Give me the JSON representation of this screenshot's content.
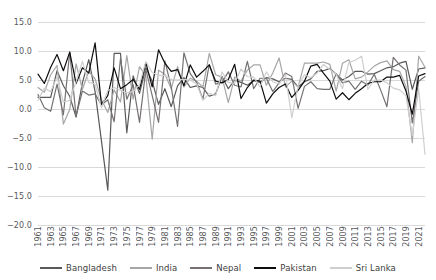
{
  "chart_data": {
    "type": "line",
    "title": "",
    "xlabel": "",
    "ylabel": "",
    "ylim": [
      -20.0,
      15.0
    ],
    "ytick_step": 5.0,
    "grid": true,
    "legend_position": "bottom",
    "y_ticks": [
      "15.0",
      "10.0",
      "5.0",
      "0.0",
      "-5.0",
      "-10.0",
      "-15.0",
      "-20.0"
    ],
    "y_tick_values": [
      15.0,
      10.0,
      5.0,
      0.0,
      -5.0,
      -10.0,
      -15.0,
      -20.0
    ],
    "x_tick_labels": [
      "1961",
      "1963",
      "1965",
      "1967",
      "1969",
      "1971",
      "1973",
      "1975",
      "1977",
      "1979",
      "1981",
      "1983",
      "1985",
      "1987",
      "1989",
      "1991",
      "1993",
      "1995",
      "1997",
      "1999",
      "2001",
      "2003",
      "2005",
      "2007",
      "2009",
      "2011",
      "2013",
      "2015",
      "2017",
      "2019",
      "2021"
    ],
    "x": [
      1961,
      1962,
      1963,
      1964,
      1965,
      1966,
      1967,
      1968,
      1969,
      1970,
      1971,
      1972,
      1973,
      1974,
      1975,
      1976,
      1977,
      1978,
      1979,
      1980,
      1981,
      1982,
      1983,
      1984,
      1985,
      1986,
      1987,
      1988,
      1989,
      1990,
      1991,
      1992,
      1993,
      1994,
      1995,
      1996,
      1997,
      1998,
      1999,
      2000,
      2001,
      2002,
      2003,
      2004,
      2005,
      2006,
      2007,
      2008,
      2009,
      2010,
      2011,
      2012,
      2013,
      2014,
      2015,
      2016,
      2017,
      2018,
      2019,
      2020,
      2021,
      2022
    ],
    "series": [
      {
        "name": "Bangladesh",
        "color": "#595959",
        "values": [
          2.0,
          2.0,
          2.0,
          6.6,
          4.0,
          2.2,
          -1.4,
          4.5,
          8.5,
          3.0,
          -5.5,
          -14.0,
          9.6,
          9.6,
          -4.1,
          5.7,
          2.7,
          7.1,
          4.8,
          0.8,
          3.5,
          0.4,
          4.0,
          5.4,
          3.7,
          4.0,
          3.7,
          2.2,
          2.6,
          5.6,
          3.5,
          5.0,
          4.6,
          4.1,
          4.9,
          4.6,
          5.4,
          5.2,
          4.7,
          5.3,
          5.1,
          3.8,
          4.7,
          5.2,
          6.5,
          6.6,
          7.0,
          6.0,
          5.0,
          5.6,
          6.5,
          6.5,
          6.0,
          6.1,
          6.6,
          7.1,
          7.3,
          7.9,
          8.2,
          3.4,
          6.9,
          7.1
        ]
      },
      {
        "name": "India",
        "color": "#a6a6a6",
        "values": [
          3.7,
          2.9,
          5.9,
          7.5,
          -2.6,
          -0.1,
          7.8,
          3.4,
          6.5,
          5.2,
          1.6,
          -0.6,
          3.3,
          1.2,
          9.2,
          1.7,
          7.3,
          5.7,
          -5.2,
          6.7,
          6.0,
          3.5,
          7.3,
          3.8,
          5.3,
          4.8,
          3.8,
          9.6,
          5.9,
          5.5,
          1.1,
          5.5,
          4.8,
          6.7,
          7.6,
          7.6,
          4.1,
          6.2,
          8.8,
          3.8,
          4.8,
          3.8,
          7.9,
          7.9,
          7.9,
          8.1,
          7.7,
          3.1,
          7.9,
          8.5,
          5.2,
          5.5,
          6.4,
          7.4,
          8.0,
          8.3,
          6.8,
          6.5,
          3.9,
          -5.8,
          9.1,
          7.2
        ]
      },
      {
        "name": "Nepal",
        "color": "#767171",
        "values": [
          2.5,
          0.2,
          -0.4,
          4.3,
          -1.0,
          9.8,
          -1.2,
          3.1,
          2.4,
          2.6,
          0.7,
          1.6,
          -2.2,
          8.7,
          1.7,
          4.2,
          -2.3,
          6.8,
          2.3,
          -2.3,
          8.3,
          3.8,
          -3.0,
          9.7,
          6.1,
          4.6,
          1.7,
          7.7,
          4.3,
          4.6,
          6.4,
          4.1,
          3.8,
          8.2,
          3.5,
          5.3,
          5.3,
          3.0,
          4.5,
          6.2,
          5.6,
          0.1,
          3.9,
          4.7,
          3.5,
          3.4,
          3.4,
          6.1,
          4.5,
          4.8,
          3.4,
          4.8,
          4.1,
          6.0,
          3.3,
          0.4,
          8.9,
          7.6,
          6.7,
          -2.4,
          4.8,
          5.6
        ]
      },
      {
        "name": "Pakistan",
        "color": "#0d0d0d",
        "values": [
          6.0,
          4.4,
          7.2,
          9.4,
          6.6,
          9.8,
          4.4,
          7.1,
          6.2,
          11.4,
          0.8,
          2.3,
          7.1,
          3.5,
          4.2,
          5.1,
          3.4,
          8.0,
          3.8,
          10.2,
          7.9,
          6.5,
          6.8,
          4.0,
          7.6,
          5.5,
          6.5,
          7.6,
          4.8,
          4.5,
          5.1,
          7.7,
          1.8,
          3.7,
          5.0,
          4.8,
          1.0,
          2.6,
          3.7,
          4.3,
          2.0,
          3.2,
          4.8,
          7.4,
          7.7,
          6.2,
          4.8,
          1.7,
          2.8,
          1.6,
          2.7,
          3.5,
          4.4,
          4.7,
          4.7,
          5.5,
          5.5,
          5.8,
          3.1,
          -0.9,
          5.7,
          6.1
        ]
      },
      {
        "name": "Sri Lanka",
        "color": "#d0cece",
        "values": [
          1.5,
          3.6,
          3.0,
          5.5,
          1.2,
          1.5,
          4.7,
          8.2,
          4.6,
          4.3,
          0.2,
          3.2,
          3.7,
          3.2,
          2.8,
          3.0,
          4.2,
          8.2,
          6.3,
          5.8,
          5.8,
          5.1,
          5.0,
          5.1,
          5.0,
          4.3,
          1.5,
          2.7,
          2.3,
          6.4,
          4.6,
          4.4,
          6.9,
          5.6,
          5.5,
          3.8,
          6.4,
          4.7,
          4.3,
          6.0,
          -1.5,
          4.0,
          5.9,
          5.4,
          6.2,
          7.7,
          6.8,
          6.0,
          3.5,
          8.0,
          8.4,
          9.1,
          3.4,
          5.0,
          5.0,
          4.5,
          3.6,
          3.3,
          2.3,
          -4.6,
          3.5,
          -7.8
        ]
      }
    ]
  },
  "legend": {
    "items": [
      {
        "label": "Bangladesh"
      },
      {
        "label": "India"
      },
      {
        "label": "Nepal"
      },
      {
        "label": "Pakistan"
      },
      {
        "label": "Sri Lanka"
      }
    ]
  }
}
